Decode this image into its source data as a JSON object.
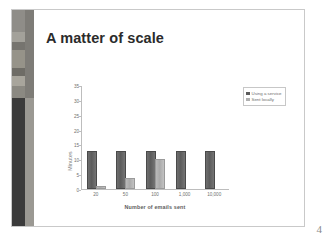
{
  "slide": {
    "title": "A matter of scale",
    "page_number": "4"
  },
  "chart_data": {
    "type": "bar",
    "title": "A matter of scale",
    "xlabel": "Number of emails sent",
    "ylabel": "Minutes",
    "categories": [
      "20",
      "50",
      "100",
      "1,000",
      "10,000"
    ],
    "series": [
      {
        "name": "Using a service",
        "values": [
          12,
          12,
          12,
          12,
          12
        ],
        "color": "#5c5c5c"
      },
      {
        "name": "Sent locally",
        "values": [
          0.4,
          3,
          9.5,
          0,
          0
        ],
        "color": "#b0b0b0"
      }
    ],
    "ylim": [
      0,
      35
    ],
    "yticks": [
      "0",
      "5",
      "10",
      "15",
      "20",
      "25",
      "30",
      "35"
    ],
    "grid": false,
    "legend_position": "right"
  }
}
